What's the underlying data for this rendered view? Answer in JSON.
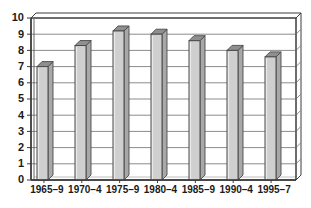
{
  "chart_data": {
    "type": "bar",
    "title": "",
    "subtitle": "",
    "xlabel": "",
    "ylabel": "",
    "categories": [
      "1965–9",
      "1970–4",
      "1975–9",
      "1980–4",
      "1985–9",
      "1990–4",
      "1995–7"
    ],
    "values": [
      7.0,
      8.3,
      9.2,
      9.0,
      8.6,
      8.0,
      7.6
    ],
    "ylim": [
      0,
      10
    ],
    "ytick_labels": [
      "0",
      "1",
      "2",
      "3",
      "4",
      "5",
      "6",
      "7",
      "8",
      "9",
      "10"
    ],
    "ytick_values": [
      0,
      1,
      2,
      3,
      4,
      5,
      6,
      7,
      8,
      9,
      10
    ],
    "grid": true,
    "grid_axis": "y",
    "legend": false,
    "legend_position": "none",
    "annotations": [],
    "style": {
      "bar_face_color": "#cfcfcf",
      "bar_edge_color": "#4a4a4a",
      "bar_top_color": "#8f8f8f",
      "bar_side_color": "#a8a8a8",
      "grid_color": "#8c8c8c",
      "axis_color": "#3d3d3d",
      "plot_background": "#ffffff",
      "text_color": "#1a1a1a"
    }
  }
}
